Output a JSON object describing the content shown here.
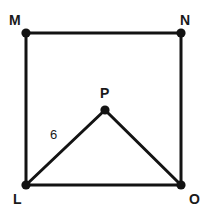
{
  "figure": {
    "canvas": {
      "width": 204,
      "height": 213,
      "background": "#ffffff"
    },
    "stroke_color": "#131313",
    "label_color": "#1a1a1a",
    "vertices": [
      {
        "id": "M",
        "label": "M",
        "x": 26,
        "y": 33,
        "label_x": 9,
        "label_y": 13
      },
      {
        "id": "N",
        "label": "N",
        "x": 181,
        "y": 33,
        "label_x": 180,
        "label_y": 13
      },
      {
        "id": "P",
        "label": "P",
        "x": 105,
        "y": 110,
        "label_x": 100,
        "label_y": 86
      },
      {
        "id": "L",
        "label": "L",
        "x": 26,
        "y": 185,
        "label_x": 13,
        "label_y": 192
      },
      {
        "id": "O",
        "label": "O",
        "x": 181,
        "y": 185,
        "label_x": 189,
        "label_y": 192
      }
    ],
    "edges": [
      {
        "id": "MN",
        "from": "M",
        "to": "N"
      },
      {
        "id": "NO",
        "from": "N",
        "to": "O"
      },
      {
        "id": "OL",
        "from": "O",
        "to": "L"
      },
      {
        "id": "LM",
        "from": "L",
        "to": "M"
      },
      {
        "id": "LP",
        "from": "L",
        "to": "P"
      },
      {
        "id": "PO",
        "from": "P",
        "to": "O"
      }
    ],
    "measurements": [
      {
        "id": "LP-length",
        "edge": "LP",
        "value": "6",
        "label_x": 50,
        "label_y": 128
      }
    ]
  }
}
